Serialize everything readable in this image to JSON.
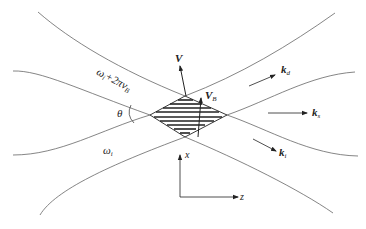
{
  "diagram": {
    "labels": {
      "upper_region": "ω",
      "upper_region_sub": "i",
      "upper_region_suffix": "+2πv",
      "upper_region_suffix_sub": "B",
      "lower_region": "ω",
      "lower_region_sub": "i",
      "angle": "θ",
      "velocity": "V",
      "velocity_b": "V",
      "velocity_b_sub": "B",
      "k_d": "k",
      "k_d_sub": "d",
      "k_s": "k",
      "k_s_sub": "s",
      "k_i": "k",
      "k_i_sub": "i",
      "axis_x": "x",
      "axis_z": "z"
    },
    "colors": {
      "line": "#555555",
      "hatch": "#222222"
    }
  }
}
